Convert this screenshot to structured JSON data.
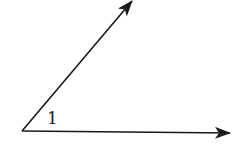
{
  "diagram": {
    "type": "angle",
    "angle_label": "1",
    "vertex": [
      22,
      131
    ],
    "rays": [
      {
        "name": "upper-ray",
        "end": [
          133,
          0
        ]
      },
      {
        "name": "horizontal-ray",
        "end": [
          230,
          132
        ]
      }
    ],
    "stroke_color": "#1a1a1a",
    "background": "#ffffff"
  }
}
